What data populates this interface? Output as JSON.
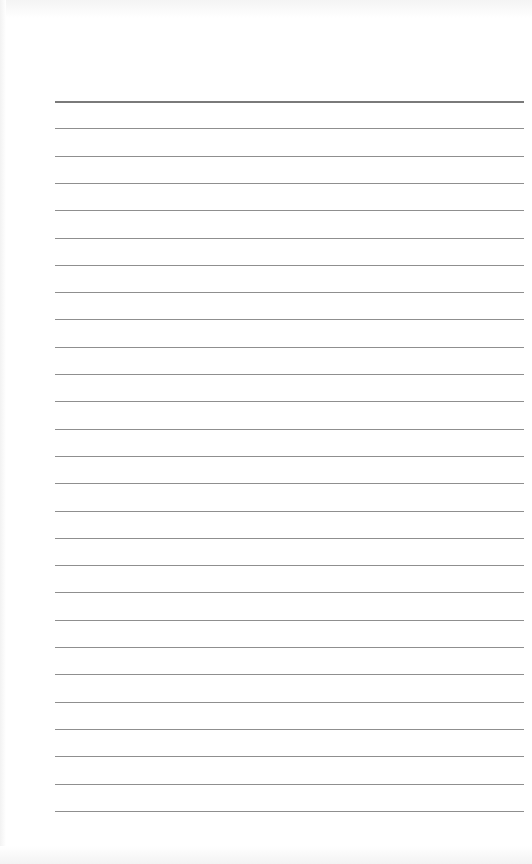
{
  "page": {
    "type": "lined-paper",
    "background": "#ffffff",
    "line_color": "#8f8f8f",
    "header_line_color": "#7a7a7a",
    "margin_left": 55,
    "line_width": 469,
    "first_line_y": 101,
    "line_spacing": 27.3,
    "line_count": 27,
    "text": ""
  }
}
